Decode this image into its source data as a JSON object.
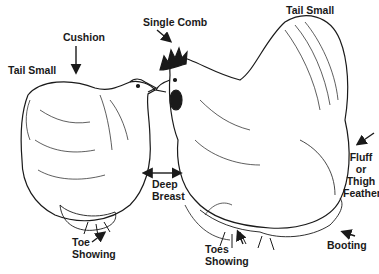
{
  "diagram": {
    "labels": {
      "tail_small_left": "Tail Small",
      "cushion": "Cushion",
      "single_comb": "Single Comb",
      "tail_small_right": "Tail Small",
      "fluff_1": "Fluff",
      "fluff_2": "or",
      "fluff_3": "Thigh",
      "fluff_4": "Feather",
      "deep_breast_1": "Deep",
      "deep_breast_2": "Breast",
      "toe_showing_1": "Toe",
      "toe_showing_2": "Showing",
      "toes_showing_1": "Toes",
      "toes_showing_2": "Showing",
      "booting": "Booting"
    },
    "colors": {
      "ink": "#1a1a1a",
      "background": "#ffffff"
    }
  }
}
